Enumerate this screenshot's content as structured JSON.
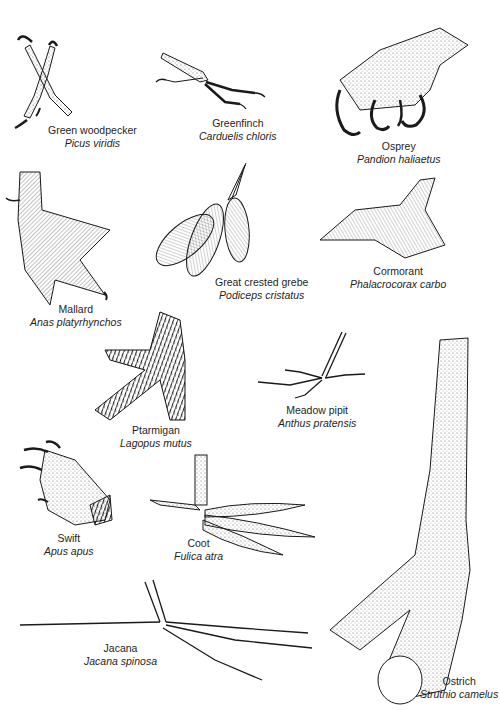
{
  "plate": {
    "subject": "Bird feet illustrations",
    "colors": {
      "background": "#ffffff",
      "ink": "#1a1a1a"
    },
    "specimens": [
      {
        "id": "green-woodpecker",
        "common": "Green woodpecker",
        "latin": "Picus viridis"
      },
      {
        "id": "greenfinch",
        "common": "Greenfinch",
        "latin": "Carduelis chloris"
      },
      {
        "id": "osprey",
        "common": "Osprey",
        "latin": "Pandion haliaetus"
      },
      {
        "id": "mallard",
        "common": "Mallard",
        "latin": "Anas platyrhynchos"
      },
      {
        "id": "great-crested-grebe",
        "common": "Great crested grebe",
        "latin": "Podiceps cristatus"
      },
      {
        "id": "cormorant",
        "common": "Cormorant",
        "latin": "Phalacrocorax carbo"
      },
      {
        "id": "ptarmigan",
        "common": "Ptarmigan",
        "latin": "Lagopus mutus"
      },
      {
        "id": "meadow-pipit",
        "common": "Meadow pipit",
        "latin": "Anthus pratensis"
      },
      {
        "id": "swift",
        "common": "Swift",
        "latin": "Apus apus"
      },
      {
        "id": "coot",
        "common": "Coot",
        "latin": "Fulica atra"
      },
      {
        "id": "jacana",
        "common": "Jacana",
        "latin": "Jacana spinosa"
      },
      {
        "id": "ostrich",
        "common": "Ostrich",
        "latin": "Struthio camelus"
      }
    ]
  }
}
